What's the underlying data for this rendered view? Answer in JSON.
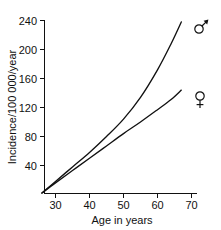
{
  "chart_data": {
    "type": "line",
    "title": "",
    "xlabel": "Age in years",
    "ylabel": "Incidence/100 000/year",
    "xlim": [
      25,
      71
    ],
    "ylim": [
      0,
      250
    ],
    "xticks": [
      30,
      40,
      50,
      60,
      70
    ],
    "yticks": [
      40,
      80,
      120,
      160,
      200,
      240
    ],
    "xtick_labels": [
      "30",
      "40",
      "50",
      "60",
      "70"
    ],
    "ytick_labels": [
      "40",
      "80",
      "120",
      "160",
      "200",
      "240"
    ],
    "grid": false,
    "legend_position": "right-inline-symbols",
    "series": [
      {
        "name": "male",
        "symbol": "♂",
        "symbol_name": "mars-symbol",
        "label": "Male",
        "x": [
          26,
          30,
          35,
          40,
          45,
          50,
          55,
          60,
          64,
          67
        ],
        "values": [
          2,
          18,
          38,
          58,
          80,
          104,
          134,
          172,
          208,
          238
        ]
      },
      {
        "name": "female",
        "symbol": "♀",
        "symbol_name": "venus-symbol",
        "label": "Female",
        "x": [
          26,
          30,
          35,
          40,
          45,
          50,
          55,
          60,
          64,
          67
        ],
        "values": [
          2,
          16,
          33,
          50,
          67,
          84,
          100,
          117,
          131,
          144
        ]
      }
    ]
  },
  "axes": {
    "x_axis_label": "Age in years",
    "y_axis_label": "Incidence/100 000/year"
  },
  "symbols": {
    "male": "♂",
    "female": "♀"
  },
  "colors": {
    "background": "#ffffff",
    "ink": "#111111",
    "curve": "#111111"
  }
}
